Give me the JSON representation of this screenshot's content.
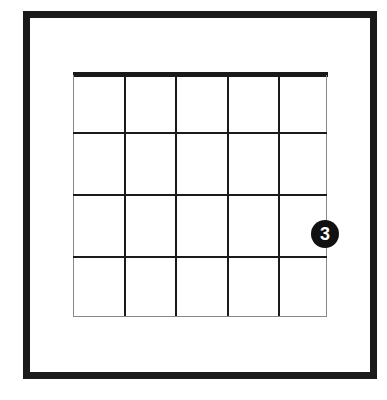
{
  "diagram": {
    "type": "guitar-chord-diagram",
    "strings": 6,
    "frets_shown": 4,
    "nut_visible": true,
    "fingering": [
      {
        "string": 1,
        "string_name": "high-e",
        "fret": 3,
        "finger_label": "3"
      }
    ],
    "colors": {
      "lines": "#1a1a1a",
      "dot": "#111111",
      "dot_text": "#ffffff",
      "background": "#ffffff"
    }
  }
}
